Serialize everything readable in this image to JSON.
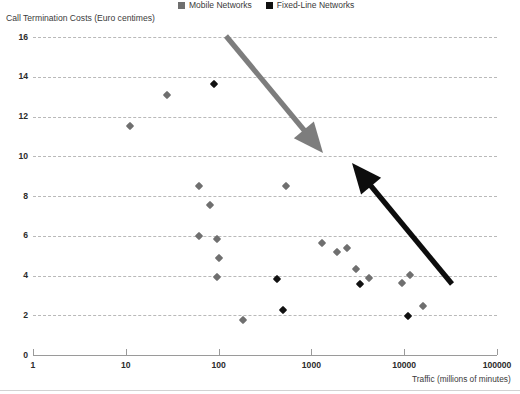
{
  "legend": {
    "items": [
      {
        "label": "Mobile Networks",
        "color": "#6f6f6f",
        "marker": "square-marker"
      },
      {
        "label": "Fixed-Line Networks",
        "color": "#111111",
        "marker": "square-marker"
      }
    ]
  },
  "chart_data": {
    "type": "scatter",
    "title": "",
    "ylabel": "Call Termination Costs (Euro centimes)",
    "xlabel": "Traffic (millions of minutes)",
    "xscale": "log",
    "xlim": [
      1,
      100000
    ],
    "ylim": [
      0,
      16
    ],
    "xticks": [
      1,
      10,
      100,
      1000,
      10000,
      100000
    ],
    "xtick_labels": [
      "1",
      "10",
      "100",
      "1000",
      "10000",
      "100000"
    ],
    "yticks": [
      0,
      2,
      4,
      6,
      8,
      10,
      12,
      14,
      16
    ],
    "ytick_labels": [
      "0",
      "2",
      "4",
      "6",
      "8",
      "10",
      "12",
      "14",
      "16"
    ],
    "grid": "horizontal-dashed",
    "legend_position": "top-center",
    "series": [
      {
        "name": "Mobile Networks",
        "color": "#6f6f6f",
        "points": [
          {
            "x": 11,
            "y": 11.5
          },
          {
            "x": 28,
            "y": 13.1
          },
          {
            "x": 62,
            "y": 8.5
          },
          {
            "x": 62,
            "y": 6.0
          },
          {
            "x": 80,
            "y": 7.55
          },
          {
            "x": 95,
            "y": 5.85
          },
          {
            "x": 100,
            "y": 4.9
          },
          {
            "x": 95,
            "y": 3.9
          },
          {
            "x": 185,
            "y": 1.75
          },
          {
            "x": 530,
            "y": 8.5
          },
          {
            "x": 1300,
            "y": 5.65
          },
          {
            "x": 1900,
            "y": 5.2
          },
          {
            "x": 2400,
            "y": 5.4
          },
          {
            "x": 3000,
            "y": 4.35
          },
          {
            "x": 4200,
            "y": 3.85
          },
          {
            "x": 9500,
            "y": 3.6
          },
          {
            "x": 11500,
            "y": 4.05
          },
          {
            "x": 16000,
            "y": 2.45
          }
        ]
      },
      {
        "name": "Fixed-Line Networks",
        "color": "#111111",
        "points": [
          {
            "x": 90,
            "y": 13.65
          },
          {
            "x": 430,
            "y": 3.8
          },
          {
            "x": 500,
            "y": 2.25
          },
          {
            "x": 3300,
            "y": 3.55
          },
          {
            "x": 11000,
            "y": 1.95
          }
        ]
      }
    ],
    "annotations": [
      {
        "name": "mobile-trend-arrow",
        "color": "#7d7d7d",
        "from": {
          "x": 226,
          "y": 36
        },
        "to": {
          "x": 323,
          "y": 153
        }
      },
      {
        "name": "fixed-line-trend-arrow",
        "color": "#0d0d0d",
        "from": {
          "x": 452,
          "y": 284
        },
        "to": {
          "x": 352,
          "y": 163
        }
      }
    ]
  }
}
